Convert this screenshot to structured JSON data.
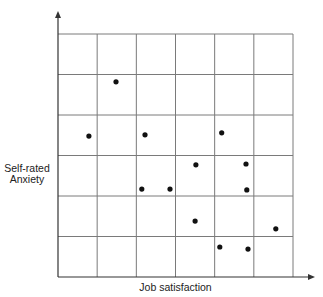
{
  "chart_data": {
    "type": "scatter",
    "title": "",
    "xlabel": "Job satisfaction",
    "ylabel": "Self-rated Anxiety",
    "grid": true,
    "xlim": [
      0,
      6
    ],
    "ylim": [
      0,
      6
    ],
    "grid_divisions": {
      "x": 6,
      "y": 6
    },
    "tick_labels": {
      "x": [],
      "y": []
    },
    "legend": null,
    "points": [
      {
        "x": 1.48,
        "y": 4.82
      },
      {
        "x": 0.79,
        "y": 3.48
      },
      {
        "x": 2.22,
        "y": 3.51
      },
      {
        "x": 4.18,
        "y": 3.56
      },
      {
        "x": 3.52,
        "y": 2.77
      },
      {
        "x": 4.8,
        "y": 2.79
      },
      {
        "x": 4.82,
        "y": 2.15
      },
      {
        "x": 2.14,
        "y": 2.17
      },
      {
        "x": 2.86,
        "y": 2.17
      },
      {
        "x": 3.5,
        "y": 1.38
      },
      {
        "x": 5.56,
        "y": 1.19
      },
      {
        "x": 4.13,
        "y": 0.74
      },
      {
        "x": 4.85,
        "y": 0.69
      }
    ]
  },
  "labels": {
    "x_axis": "Job satisfaction",
    "y_axis_line1": "Self-rated",
    "y_axis_line2": "Anxiety"
  },
  "colors": {
    "grid": "#7a7a7a",
    "axis": "#333333",
    "point": "#111111"
  }
}
